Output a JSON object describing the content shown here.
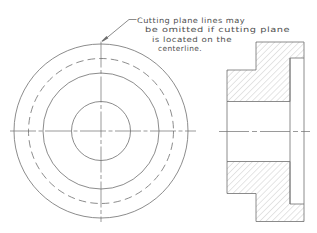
{
  "note": {
    "lines": [
      "Cutting plane lines may",
      "be omitted if cutting plane",
      "is located on the",
      "centerline."
    ]
  },
  "colors": {
    "background": "#ffffff",
    "line": "#6e6e6e",
    "hatch": "#a0a0a0",
    "text": "#4f4f4f"
  }
}
